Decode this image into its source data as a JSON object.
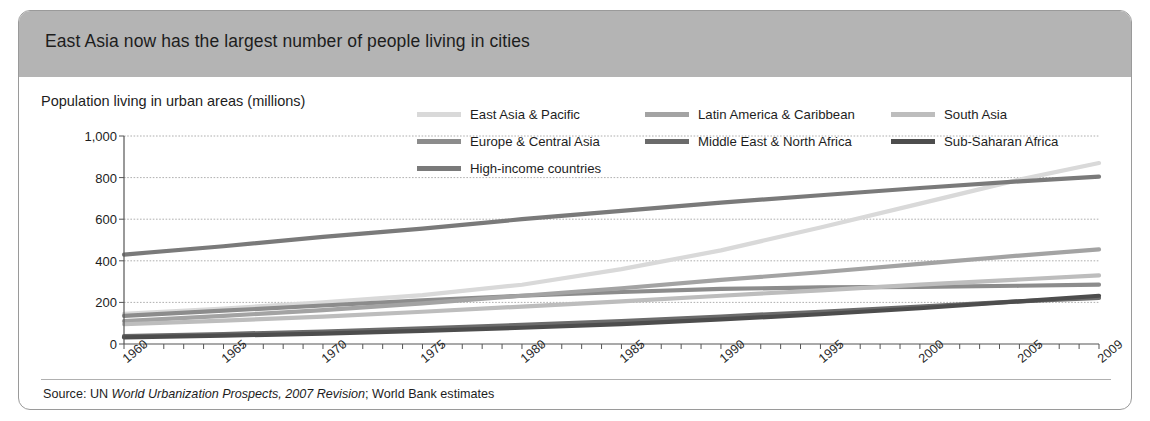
{
  "header": {
    "title": "East Asia now has the largest number of people living in cities"
  },
  "subtitle": "Population living in urban areas (millions)",
  "source": {
    "prefix": "Source: UN ",
    "italic1": "World Urbanization Prospects, 2007 Revision",
    "middle": "; World Bank estimates"
  },
  "colors": {
    "header_bar": "#b4b4b4",
    "frame": "#9a9a9a",
    "axis": "#555555",
    "grid": "#9a9a9a",
    "east_asia_pacific": "#d9d9d9",
    "europe_central_asia": "#8c8c8c",
    "high_income": "#7a7a7a",
    "latin_america_caribbean": "#a3a3a3",
    "middle_east_north_africa": "#6b6b6b",
    "south_asia": "#bdbdbd",
    "sub_saharan_africa": "#4d4d4d"
  },
  "legend": {
    "items": [
      {
        "label": "East Asia & Pacific",
        "color": "#d9d9d9",
        "col": 1,
        "row": 1
      },
      {
        "label": "Europe & Central Asia",
        "color": "#8c8c8c",
        "col": 1,
        "row": 2
      },
      {
        "label": "High-income countries",
        "color": "#7a7a7a",
        "col": 1,
        "row": 3
      },
      {
        "label": "Latin America & Caribbean",
        "color": "#a3a3a3",
        "col": 2,
        "row": 1
      },
      {
        "label": "Middle East & North Africa",
        "color": "#6b6b6b",
        "col": 2,
        "row": 2
      },
      {
        "label": "South Asia",
        "color": "#bdbdbd",
        "col": 3,
        "row": 1
      },
      {
        "label": "Sub-Saharan Africa",
        "color": "#4d4d4d",
        "col": 3,
        "row": 2
      }
    ]
  },
  "chart_data": {
    "type": "line",
    "title": "East Asia now has the largest number of people living in cities",
    "subtitle": "Population living in urban areas (millions)",
    "xlabel": "",
    "ylabel": "Population living in urban areas (millions)",
    "xlim": [
      1960,
      2009
    ],
    "ylim": [
      0,
      1000
    ],
    "yticks": [
      0,
      200,
      400,
      600,
      800,
      1000
    ],
    "ytick_labels": [
      "0",
      "200",
      "400",
      "600",
      "800",
      "1,000"
    ],
    "xticks": [
      1960,
      1965,
      1970,
      1975,
      1980,
      1985,
      1990,
      1995,
      2000,
      2005,
      2009
    ],
    "xtick_labels": [
      "1960",
      "1965",
      "1970",
      "1975",
      "1980",
      "1985",
      "1990",
      "1995",
      "2000",
      "2005",
      "2009"
    ],
    "x_minor_tick_interval": 1,
    "grid": "horizontal",
    "legend_position": "top-right",
    "x": [
      1960,
      1965,
      1970,
      1975,
      1980,
      1985,
      1990,
      1995,
      2000,
      2005,
      2009
    ],
    "series": [
      {
        "name": "East Asia & Pacific",
        "color": "#d9d9d9",
        "values": [
          145,
          170,
          200,
          235,
          285,
          360,
          450,
          560,
          675,
          790,
          870
        ]
      },
      {
        "name": "High-income countries",
        "color": "#7a7a7a",
        "values": [
          430,
          470,
          515,
          555,
          600,
          640,
          680,
          715,
          750,
          782,
          805
        ]
      },
      {
        "name": "Europe & Central Asia",
        "color": "#8c8c8c",
        "values": [
          135,
          160,
          185,
          210,
          232,
          250,
          265,
          272,
          275,
          280,
          285
        ]
      },
      {
        "name": "Latin America & Caribbean",
        "color": "#a3a3a3",
        "values": [
          110,
          135,
          163,
          195,
          232,
          268,
          308,
          345,
          385,
          425,
          455
        ]
      },
      {
        "name": "South Asia",
        "color": "#bdbdbd",
        "values": [
          95,
          112,
          132,
          155,
          180,
          205,
          232,
          258,
          285,
          310,
          330
        ]
      },
      {
        "name": "Middle East & North Africa",
        "color": "#6b6b6b",
        "values": [
          38,
          48,
          60,
          75,
          92,
          110,
          132,
          155,
          180,
          205,
          222
        ]
      },
      {
        "name": "Sub-Saharan Africa",
        "color": "#4d4d4d",
        "values": [
          32,
          40,
          50,
          63,
          78,
          96,
          118,
          143,
          172,
          205,
          232
        ]
      }
    ]
  }
}
